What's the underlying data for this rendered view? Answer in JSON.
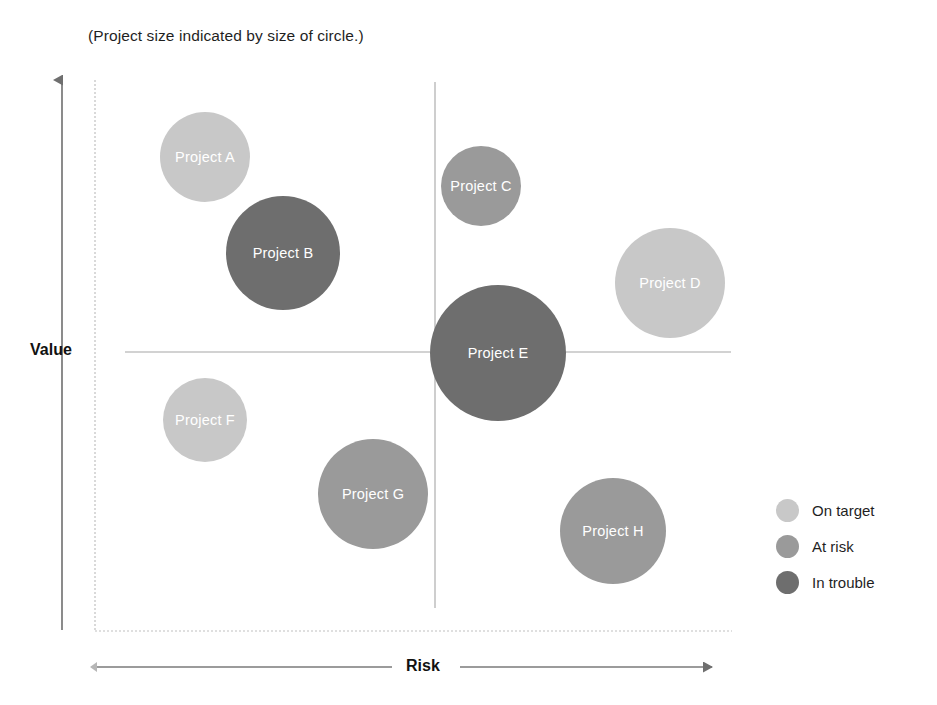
{
  "caption": "(Project size indicated by size of circle.)",
  "axes": {
    "y_label": "Value",
    "x_label": "Risk"
  },
  "colors": {
    "on_target": "#c8c8c8",
    "at_risk": "#9a9a9a",
    "in_trouble": "#6e6e6e",
    "axis_line": "#7a7a7a",
    "quadrant_line": "#9b9b9b",
    "boundary_line": "#b9b9b9",
    "label_text": "#ffffff"
  },
  "legend": {
    "items": [
      {
        "label": "On target",
        "status": "on_target",
        "color": "#c8c8c8"
      },
      {
        "label": "At risk",
        "status": "at_risk",
        "color": "#9a9a9a"
      },
      {
        "label": "In trouble",
        "status": "in_trouble",
        "color": "#6e6e6e"
      }
    ]
  },
  "chart_data": {
    "type": "scatter",
    "title": "",
    "subtitle": "(Project size indicated by size of circle.)",
    "xlabel": "Risk",
    "ylabel": "Value",
    "xlim": [
      0,
      100
    ],
    "ylim": [
      0,
      100
    ],
    "grid": false,
    "legend_position": "right",
    "size_encoding": "Project size indicated by size of circle.",
    "quadrant_lines": {
      "x": 56,
      "y": 50
    },
    "series": [
      {
        "name": "On target",
        "color": "#c8c8c8"
      },
      {
        "name": "At risk",
        "color": "#9a9a9a"
      },
      {
        "name": "In trouble",
        "color": "#6e6e6e"
      }
    ],
    "points": [
      {
        "label": "Project A",
        "status": "On target",
        "color": "#c8c8c8",
        "x": 17,
        "y": 83,
        "r": 45,
        "cx": 205,
        "cy": 157
      },
      {
        "label": "Project B",
        "status": "In trouble",
        "color": "#6e6e6e",
        "x": 30,
        "y": 66,
        "r": 57,
        "cx": 283,
        "cy": 253
      },
      {
        "label": "Project C",
        "status": "At risk",
        "color": "#9a9a9a",
        "x": 62,
        "y": 78,
        "r": 40,
        "cx": 481,
        "cy": 186
      },
      {
        "label": "Project D",
        "status": "On target",
        "color": "#c8c8c8",
        "x": 92,
        "y": 60,
        "r": 55,
        "cx": 670,
        "cy": 283
      },
      {
        "label": "Project E",
        "status": "In trouble",
        "color": "#6e6e6e",
        "x": 65,
        "y": 50,
        "r": 68,
        "cx": 498,
        "cy": 353
      },
      {
        "label": "Project F",
        "status": "On target",
        "color": "#c8c8c8",
        "x": 17,
        "y": 38,
        "r": 42,
        "cx": 205,
        "cy": 420
      },
      {
        "label": "Project G",
        "status": "At risk",
        "color": "#9a9a9a",
        "x": 44,
        "y": 25,
        "r": 55,
        "cx": 373,
        "cy": 494
      },
      {
        "label": "Project H",
        "status": "At risk",
        "color": "#9a9a9a",
        "x": 83,
        "y": 18,
        "r": 53,
        "cx": 613,
        "cy": 531
      }
    ]
  }
}
